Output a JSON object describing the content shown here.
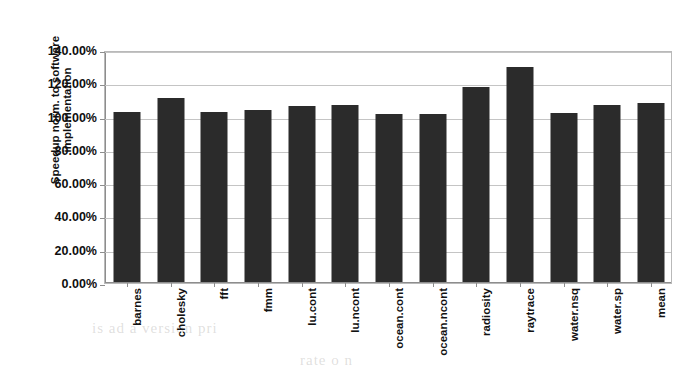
{
  "chart_data": {
    "type": "bar",
    "title": "",
    "xlabel": "",
    "ylabel": "Speedup norm. to software implementation",
    "ylim": [
      0,
      140
    ],
    "ytick_labels": [
      "140.00%",
      "120.00%",
      "100.00%",
      "80.00%",
      "60.00%",
      "40.00%",
      "20.00%",
      "0.00%"
    ],
    "ytick_values": [
      140,
      120,
      100,
      80,
      60,
      40,
      20,
      0
    ],
    "grid": true,
    "legend": "none",
    "bar_color": "#2b2b2b",
    "categories": [
      "barnes",
      "cholesky",
      "fft",
      "fmm",
      "lu.cont",
      "lu.ncont",
      "ocean.cont",
      "ocean.ncont",
      "radiosity",
      "raytrace",
      "water.nsq",
      "water.sp",
      "mean"
    ],
    "values": [
      103.0,
      111.0,
      102.5,
      104.0,
      106.5,
      107.0,
      101.5,
      101.5,
      118.0,
      129.5,
      102.0,
      107.0,
      108.0
    ]
  },
  "background_text": [
    "hardware",
    "is ad   a version pri",
    "rate   o n"
  ]
}
